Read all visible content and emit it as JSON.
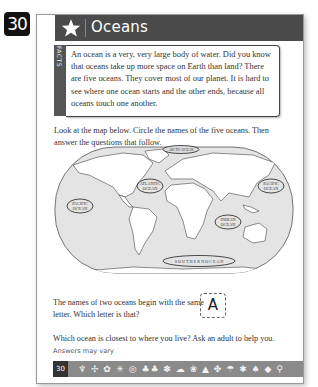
{
  "page_badge": "30",
  "header": {
    "icon": "star-icon",
    "title": "Oceans"
  },
  "facts": {
    "tab_label": "FACTS",
    "text": "An ocean is a very, very large body of water. Did you know that oceans take up more space on Earth than land? There are five oceans. They cover most of our planet. It is hard to see where one ocean starts and the other ends, because all oceans touch one another."
  },
  "instructions": "Look at the map below. Circle the names of the five oceans. Then answer the questions that follow.",
  "map": {
    "labels": [
      {
        "name": "ARCTIC OCEAN",
        "line1": "ARCTIC OCEAN",
        "line2": ""
      },
      {
        "name": "ATLANTIC OCEAN",
        "line1": "ATLANTIC",
        "line2": "OCEAN"
      },
      {
        "name": "PACIFIC OCEAN (west)",
        "line1": "PACIFIC",
        "line2": "OCEAN"
      },
      {
        "name": "PACIFIC OCEAN (east)",
        "line1": "PACIFIC",
        "line2": "OCEAN"
      },
      {
        "name": "INDIAN OCEAN",
        "line1": "INDIAN",
        "line2": "OCEAN"
      },
      {
        "name": "SOUTHERN OCEAN",
        "line1": "S O U T H E R N   O C E A N",
        "line2": ""
      }
    ]
  },
  "question1": {
    "text": "The names of two oceans begin with the same letter. Which letter is that?",
    "answer": "A"
  },
  "question2": {
    "text": "Which ocean is closest to where you live? Ask an adult to help you.",
    "answer_note": "Answers may vary"
  },
  "footer": {
    "page_number": "30",
    "icons": "♆ ✢ ✿ ☀ ◎ ♣♣ ✽ ☁ ❀ ▲ ✤ ☂ ✱ ♠ ◆ ⚲"
  }
}
